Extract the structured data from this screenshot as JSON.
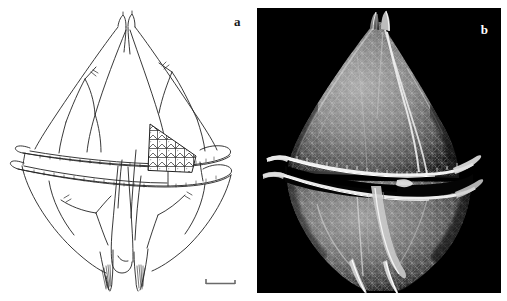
{
  "figure": {
    "kind": "two-panel scientific micrograph figure",
    "background_color": "#ffffff",
    "width": 507,
    "height": 301
  },
  "panels": [
    {
      "id": "a",
      "label": "a",
      "label_color": "#1a1a1a",
      "type": "line-drawing",
      "background_color": "#ffffff",
      "line_color": "#222222",
      "subject": "dinoflagellate theca, ventral view line drawing",
      "features": [
        "apical horn",
        "epitheca plates",
        "cingulum with two striated lists",
        "reticulated triangular plate patch",
        "hypotheca plates",
        "sulcus",
        "two antapical spines"
      ],
      "scalebar": {
        "name": "scale-bar",
        "color": "#555555",
        "length_px": 31
      }
    },
    {
      "id": "b",
      "label": "b",
      "label_color": "#ffffff",
      "type": "sem-micrograph",
      "background_color": "#000000",
      "subject": "dinoflagellate theca, scanning electron micrograph",
      "features": [
        "apical horn",
        "reticulate areolate surface",
        "cingulum with raised lists",
        "sulcal flange",
        "two antapical spines"
      ],
      "scalebar": {
        "name": "scale-bar",
        "color": "#f2f2f2",
        "length_px": 37
      }
    }
  ],
  "colors": {
    "page_background": "#ffffff",
    "drawing_ink": "#222222",
    "micrograph_background": "#000000",
    "micrograph_highlight": "#f0f0f0",
    "micrograph_midtone": "#8a8a8a",
    "micrograph_shadow": "#2b2b2b"
  }
}
